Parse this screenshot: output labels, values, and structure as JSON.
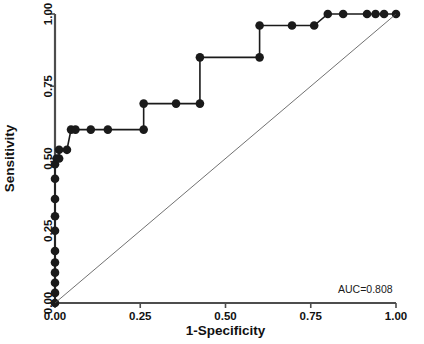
{
  "chart_data": {
    "type": "line",
    "title": "",
    "subtitle": "",
    "xlabel": "1-Specificity",
    "ylabel": "Sensitivity",
    "xlim": [
      0,
      1
    ],
    "ylim": [
      0,
      1
    ],
    "grid": false,
    "legend": false,
    "legend_position": "none",
    "xticks": [
      "0.00",
      "0.25",
      "0.50",
      "0.75",
      "1.00"
    ],
    "xtick_values": [
      0.0,
      0.25,
      0.5,
      0.75,
      1.0
    ],
    "yticks": [
      "0.00",
      "0.25",
      "0.50",
      "0.75",
      "1.00"
    ],
    "ytick_values": [
      0.0,
      0.25,
      0.5,
      0.75,
      1.0
    ],
    "annotations": [
      {
        "name": "auc-label",
        "text": "AUC=0.808",
        "x": 0.99,
        "y": 0.035
      }
    ],
    "series": [
      {
        "name": "ROC curve",
        "color": "#1a1a1a",
        "marker": "circle",
        "marker_size": 4.3,
        "line_width": 1.6,
        "x": [
          0.0,
          0.0,
          0.0,
          0.0,
          0.0,
          0.0,
          0.0,
          0.0,
          0.0,
          0.0,
          0.0,
          0.005,
          0.012,
          0.012,
          0.035,
          0.047,
          0.06,
          0.105,
          0.155,
          0.26,
          0.26,
          0.355,
          0.425,
          0.425,
          0.6,
          0.6,
          0.695,
          0.76,
          0.8,
          0.845,
          0.915,
          0.94,
          0.965,
          1.0
        ],
        "y": [
          0.0,
          0.035,
          0.07,
          0.105,
          0.14,
          0.18,
          0.25,
          0.3,
          0.36,
          0.43,
          0.48,
          0.5,
          0.5,
          0.53,
          0.53,
          0.6,
          0.6,
          0.6,
          0.6,
          0.6,
          0.69,
          0.69,
          0.69,
          0.85,
          0.85,
          0.96,
          0.96,
          0.96,
          1.0,
          1.0,
          1.0,
          1.0,
          1.0,
          1.0
        ]
      },
      {
        "name": "Reference diagonal",
        "color": "#4d4d4d",
        "marker": "none",
        "marker_size": 0,
        "line_width": 0.8,
        "x": [
          0.0,
          1.0
        ],
        "y": [
          0.0,
          1.0
        ]
      }
    ]
  },
  "axes": {
    "x_axis_name": "x-axis",
    "y_axis_name": "y-axis",
    "xlabel": "1-Specificity",
    "ylabel": "Sensitivity"
  }
}
